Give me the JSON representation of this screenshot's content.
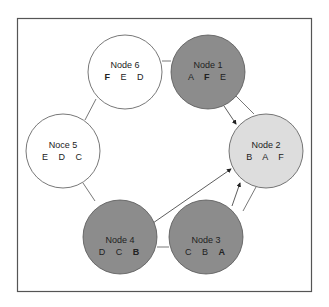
{
  "diagram": {
    "type": "ring-network",
    "frame": {
      "x": 17,
      "y": 18,
      "w": 295,
      "h": 274,
      "stroke": "#555555"
    },
    "colors": {
      "dark": "#8c8c8c",
      "light": "#dddddd",
      "white": "#ffffff",
      "stroke": "#555555"
    },
    "nodes": [
      {
        "id": "node6",
        "label": "Node 6",
        "keys": [
          {
            "k": "F",
            "bold": true
          },
          {
            "k": "E",
            "bold": false
          },
          {
            "k": "D",
            "bold": false
          }
        ],
        "cx": 125,
        "cy": 72,
        "r": 37,
        "fill": "#ffffff"
      },
      {
        "id": "node1",
        "label": "Node 1",
        "keys": [
          {
            "k": "A",
            "bold": false
          },
          {
            "k": "F",
            "bold": true
          },
          {
            "k": "E",
            "bold": false
          }
        ],
        "cx": 208,
        "cy": 72,
        "r": 37,
        "fill": "#8c8c8c"
      },
      {
        "id": "node5",
        "label": "Noce 5",
        "keys": [
          {
            "k": "E",
            "bold": false
          },
          {
            "k": "D",
            "bold": false
          },
          {
            "k": "C",
            "bold": false
          }
        ],
        "cx": 63,
        "cy": 151,
        "r": 37,
        "fill": "#ffffff"
      },
      {
        "id": "node2",
        "label": "Node 2",
        "keys": [
          {
            "k": "B",
            "bold": false
          },
          {
            "k": "A",
            "bold": false
          },
          {
            "k": "F",
            "bold": false
          }
        ],
        "cx": 266,
        "cy": 151,
        "r": 37,
        "fill": "#dddddd"
      },
      {
        "id": "node4",
        "label": "Node 4",
        "keys": [
          {
            "k": "D",
            "bold": false
          },
          {
            "k": "C",
            "bold": false
          },
          {
            "k": "B",
            "bold": true
          }
        ],
        "cx": 120,
        "cy": 237,
        "r": 37,
        "fill": "#8c8c8c"
      },
      {
        "id": "node3",
        "label": "Node 3",
        "keys": [
          {
            "k": "C",
            "bold": false
          },
          {
            "k": "B",
            "bold": false
          },
          {
            "k": "A",
            "bold": true
          }
        ],
        "cx": 206,
        "cy": 237,
        "r": 37,
        "fill": "#8c8c8c"
      }
    ],
    "text": {
      "node6": {
        "label": "Node 6",
        "k1": "F",
        "k2": "E",
        "k3": "D"
      },
      "node1": {
        "label": "Node 1",
        "k1": "A",
        "k2": "F",
        "k3": "E"
      },
      "node5": {
        "label": "Noce 5",
        "k1": "E",
        "k2": "D",
        "k3": "C"
      },
      "node2": {
        "label": "Node 2",
        "k1": "B",
        "k2": "A",
        "k3": "F"
      },
      "node4": {
        "label": "Node 4",
        "k1": "D",
        "k2": "C",
        "k3": "B"
      },
      "node3": {
        "label": "Node 3",
        "k1": "C",
        "k2": "B",
        "k3": "A"
      }
    },
    "edges": [
      {
        "from": "node6",
        "to": "node1",
        "type": "line"
      },
      {
        "from": "node6",
        "to": "node5",
        "type": "line"
      },
      {
        "from": "node5",
        "to": "node4",
        "type": "line"
      },
      {
        "from": "node4",
        "to": "node3",
        "type": "line"
      },
      {
        "from": "node3",
        "to": "node2",
        "type": "line"
      },
      {
        "from": "node1",
        "to": "node2",
        "type": "line"
      },
      {
        "from": "node1",
        "to": "node2",
        "type": "arrow"
      },
      {
        "from": "node3",
        "to": "node2",
        "type": "arrow"
      },
      {
        "from": "node4",
        "to": "node2",
        "type": "arrow"
      }
    ]
  }
}
